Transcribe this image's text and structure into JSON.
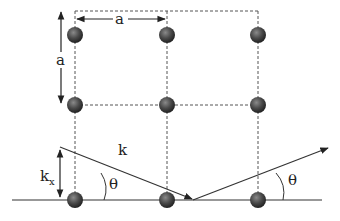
{
  "diagram": {
    "labels": {
      "lattice_horizontal": "a",
      "lattice_vertical": "a",
      "wavevector": "k",
      "component_main": "k",
      "component_sub": "x",
      "angle_incident": "θ",
      "angle_reflected": "θ"
    },
    "lattice": {
      "columns_x": [
        75,
        167,
        258
      ],
      "rows_y": [
        35,
        105,
        200
      ],
      "atom_radius": 8,
      "atom_color": "#3a3a3a"
    },
    "colors": {
      "line": "#333333",
      "dashed": "#555555",
      "background": "#ffffff"
    }
  }
}
